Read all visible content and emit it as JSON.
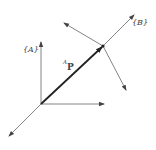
{
  "diagram": {
    "type": "coordinate-frames",
    "frame_a": {
      "label": "{A}",
      "origin": [
        41,
        104
      ]
    },
    "frame_b": {
      "label": "{B}",
      "origin": [
        103,
        46
      ]
    },
    "vector": {
      "label_super": "A",
      "label_main": "P",
      "from": "frame_a.origin",
      "to": "frame_b.origin"
    },
    "colors": {
      "line": "#555555",
      "vector": "#222222",
      "background": "#ffffff"
    }
  }
}
